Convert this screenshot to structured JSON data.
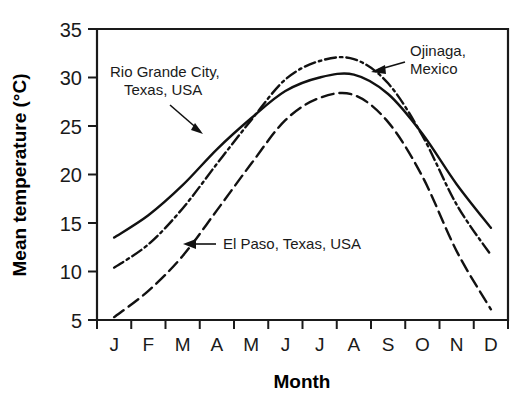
{
  "chart_data": {
    "type": "line",
    "title": "",
    "xlabel": "Month",
    "ylabel": "Mean temperature (°C)",
    "categories": [
      "J",
      "F",
      "M",
      "A",
      "M",
      "J",
      "J",
      "A",
      "S",
      "O",
      "N",
      "D"
    ],
    "x_tick_labels": [
      "J",
      "F",
      "M",
      "A",
      "M",
      "J",
      "J",
      "A",
      "S",
      "O",
      "N",
      "D"
    ],
    "y_tick_labels": [
      "5",
      "10",
      "15",
      "20",
      "25",
      "30",
      "35"
    ],
    "y_ticks": [
      5,
      10,
      15,
      20,
      25,
      30,
      35
    ],
    "ylim": [
      5,
      35
    ],
    "xlim": [
      0,
      12
    ],
    "grid": false,
    "legend_position": "inline-annotations",
    "series": [
      {
        "name": "Rio Grande City, Texas, USA",
        "style": "solid",
        "values": [
          13.5,
          15.8,
          18.9,
          22.6,
          25.8,
          28.6,
          30.0,
          30.3,
          28.3,
          24.2,
          19.0,
          14.5
        ]
      },
      {
        "name": "Ojinaga, Mexico",
        "style": "dash-dot",
        "values": [
          10.4,
          12.8,
          16.5,
          21.1,
          25.6,
          29.8,
          31.7,
          31.9,
          29.4,
          24.0,
          16.9,
          11.7
        ]
      },
      {
        "name": "El Paso, Texas, USA",
        "style": "dashed",
        "values": [
          5.3,
          8.0,
          11.6,
          16.3,
          21.1,
          25.6,
          27.9,
          28.2,
          25.4,
          19.8,
          12.1,
          6.1
        ]
      }
    ],
    "annotations": [
      {
        "id": "rio-grande-annotation",
        "lines": [
          "Rio Grande City,",
          "Texas, USA"
        ],
        "target_series": "Rio Grande City, Texas, USA"
      },
      {
        "id": "ojinaga-annotation",
        "lines": [
          "Ojinaga,",
          "Mexico"
        ],
        "target_series": "Ojinaga, Mexico"
      },
      {
        "id": "el-paso-annotation",
        "lines": [
          "El Paso, Texas, USA"
        ],
        "target_series": "El Paso, Texas, USA"
      }
    ],
    "colors": {
      "line": "#111111",
      "axis": "#1a1a1a",
      "background": "#ffffff"
    }
  }
}
